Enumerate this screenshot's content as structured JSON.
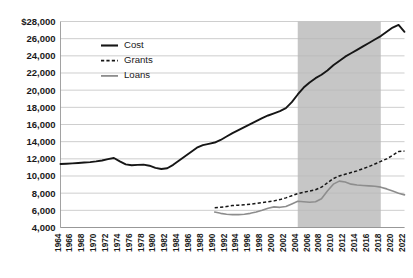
{
  "chart_data": {
    "type": "line",
    "title": "",
    "subtitle": "",
    "xlabel": "",
    "ylabel": "",
    "xlim": [
      1964,
      2022
    ],
    "ylim": [
      4000,
      28000
    ],
    "grid": true,
    "legend_position": "upper-left-inside",
    "ytick_labels": [
      "$28,000",
      "26,000",
      "24,000",
      "22,000",
      "20,000",
      "18,000",
      "16,000",
      "14,000",
      "12,000",
      "10,000",
      "8,000",
      "6,000",
      "4,000"
    ],
    "ytick_values": [
      28000,
      26000,
      24000,
      22000,
      20000,
      18000,
      16000,
      14000,
      12000,
      10000,
      8000,
      6000,
      4000
    ],
    "xtick_labels": [
      "1964",
      "1966",
      "1968",
      "1970",
      "1972",
      "1974",
      "1976",
      "1978",
      "1980",
      "1982",
      "1984",
      "1986",
      "1988",
      "1990",
      "1992",
      "1994",
      "1996",
      "1998",
      "2000",
      "2002",
      "2004",
      "2006",
      "2008",
      "2010",
      "2012",
      "2014",
      "2016",
      "2018",
      "2020",
      "2022"
    ],
    "xtick_values": [
      1964,
      1966,
      1968,
      1970,
      1972,
      1974,
      1976,
      1978,
      1980,
      1982,
      1984,
      1986,
      1988,
      1990,
      1992,
      1994,
      1996,
      1998,
      2000,
      2002,
      2004,
      2006,
      2008,
      2010,
      2012,
      2014,
      2016,
      2018,
      2020,
      2022
    ],
    "shaded_region": {
      "start": 2004,
      "end": 2018,
      "color": "#c3c3c3"
    },
    "series": [
      {
        "name": "Cost",
        "style": "solid",
        "color": "#161616",
        "x": [
          1964,
          1965,
          1966,
          1967,
          1968,
          1969,
          1970,
          1971,
          1972,
          1973,
          1974,
          1975,
          1976,
          1977,
          1978,
          1979,
          1980,
          1981,
          1982,
          1983,
          1984,
          1985,
          1986,
          1987,
          1988,
          1989,
          1990,
          1991,
          1992,
          1993,
          1994,
          1995,
          1996,
          1997,
          1998,
          1999,
          2000,
          2001,
          2002,
          2003,
          2004,
          2005,
          2006,
          2007,
          2008,
          2009,
          2010,
          2011,
          2012,
          2013,
          2014,
          2015,
          2016,
          2017,
          2018,
          2019,
          2020,
          2021,
          2022
        ],
        "values": [
          11400,
          11430,
          11470,
          11520,
          11570,
          11620,
          11700,
          11800,
          11960,
          12100,
          11700,
          11350,
          11250,
          11300,
          11330,
          11200,
          10950,
          10820,
          10900,
          11300,
          11800,
          12300,
          12800,
          13300,
          13600,
          13750,
          13900,
          14200,
          14600,
          15000,
          15350,
          15700,
          16050,
          16400,
          16750,
          17050,
          17300,
          17550,
          17900,
          18600,
          19500,
          20300,
          20900,
          21400,
          21800,
          22300,
          22900,
          23400,
          23900,
          24300,
          24700,
          25100,
          25500,
          25900,
          26300,
          26800,
          27300,
          27600,
          26800
        ]
      },
      {
        "name": "Grants",
        "style": "dashed",
        "color": "#161616",
        "x": [
          1990,
          1991,
          1992,
          1993,
          1994,
          1995,
          1996,
          1997,
          1998,
          1999,
          2000,
          2001,
          2002,
          2003,
          2004,
          2005,
          2006,
          2007,
          2008,
          2009,
          2010,
          2011,
          2012,
          2013,
          2014,
          2015,
          2016,
          2017,
          2018,
          2019,
          2020,
          2021,
          2022
        ],
        "values": [
          6300,
          6350,
          6450,
          6550,
          6600,
          6650,
          6700,
          6800,
          6900,
          7000,
          7100,
          7250,
          7450,
          7700,
          7950,
          8100,
          8250,
          8400,
          8700,
          9200,
          9700,
          10000,
          10200,
          10400,
          10600,
          10850,
          11100,
          11400,
          11700,
          12000,
          12400,
          12850,
          12900
        ]
      },
      {
        "name": "Loans",
        "style": "solid",
        "color": "#8d8d8d",
        "x": [
          1990,
          1991,
          1992,
          1993,
          1994,
          1995,
          1996,
          1997,
          1998,
          1999,
          2000,
          2001,
          2002,
          2003,
          2004,
          2005,
          2006,
          2007,
          2008,
          2009,
          2010,
          2011,
          2012,
          2013,
          2014,
          2015,
          2016,
          2017,
          2018,
          2019,
          2020,
          2021,
          2022
        ],
        "values": [
          5800,
          5650,
          5550,
          5500,
          5500,
          5550,
          5650,
          5800,
          6000,
          6250,
          6400,
          6350,
          6450,
          6750,
          7050,
          7000,
          6950,
          7000,
          7350,
          8250,
          9050,
          9400,
          9300,
          9050,
          8950,
          8900,
          8850,
          8800,
          8700,
          8500,
          8250,
          8000,
          7800
        ]
      }
    ]
  },
  "legend": {
    "items": [
      {
        "label": "Cost"
      },
      {
        "label": "Grants"
      },
      {
        "label": "Loans"
      }
    ]
  },
  "caption": {
    "text": ""
  }
}
